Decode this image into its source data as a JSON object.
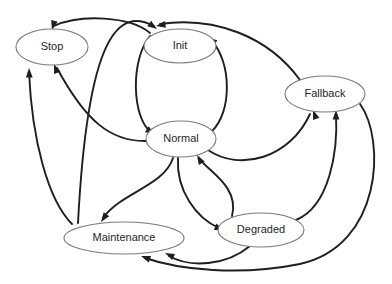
{
  "diagram": {
    "type": "state-transition-diagram",
    "title": "",
    "background_color": "#ffffff",
    "node_fill": "#ffffff",
    "node_stroke": "#7a7a7a",
    "edge_color": "#1f1f1f",
    "label_color": "#262626",
    "nodes": [
      {
        "id": "stop",
        "label": "Stop",
        "cx": 52,
        "cy": 47,
        "rx": 36,
        "ry": 18
      },
      {
        "id": "init",
        "label": "Init",
        "cx": 180,
        "cy": 46,
        "rx": 36,
        "ry": 17
      },
      {
        "id": "fallback",
        "label": "Fallback",
        "cx": 325,
        "cy": 94,
        "rx": 40,
        "ry": 18
      },
      {
        "id": "normal",
        "label": "Normal",
        "cx": 181,
        "cy": 139,
        "rx": 35,
        "ry": 18
      },
      {
        "id": "maintenance",
        "label": "Maintenance",
        "cx": 124,
        "cy": 238,
        "rx": 60,
        "ry": 16
      },
      {
        "id": "degraded",
        "label": "Degraded",
        "cx": 261,
        "cy": 230,
        "rx": 43,
        "ry": 17
      }
    ],
    "edges": [
      {
        "from": "init",
        "to": "stop",
        "path": "M 150 33 C 130 16 80 14 54 26",
        "arrow_at": [
          52,
          30
        ],
        "arrow_angle": 105
      },
      {
        "from": "init",
        "to": "normal",
        "path": "M 150 36 C 130 60 132 118 151 132",
        "arrow_at": [
          155,
          134
        ],
        "arrow_angle": 30
      },
      {
        "from": "normal",
        "to": "init",
        "path": "M 212 131 C 232 112 232 62 211 40",
        "arrow_at": [
          208,
          37
        ],
        "arrow_angle": 220
      },
      {
        "from": "normal",
        "to": "stop",
        "path": "M 147 141 C 110 142 85 120 57 68",
        "arrow_at": [
          54,
          64
        ],
        "arrow_angle": 250
      },
      {
        "from": "normal",
        "to": "fallback",
        "path": "M 208 150 C 240 172 290 158 310 114",
        "arrow_at": [
          313,
          110
        ],
        "arrow_angle": 250
      },
      {
        "from": "normal",
        "to": "degraded",
        "path": "M 178 158 C 176 190 196 218 219 228",
        "arrow_at": [
          224,
          230
        ],
        "arrow_angle": 20
      },
      {
        "from": "normal",
        "to": "maintenance",
        "path": "M 173 158 C 164 186 122 192 103 218",
        "arrow_at": [
          101,
          222
        ],
        "arrow_angle": 125
      },
      {
        "from": "maintenance",
        "to": "stop",
        "path": "M 72 224 C 48 200 32 140 29 72",
        "arrow_at": [
          29,
          68
        ],
        "arrow_angle": 268
      },
      {
        "from": "maintenance",
        "to": "init",
        "path": "M 78 223 C 88 30 120 8 154 26",
        "arrow_at": [
          157,
          29
        ],
        "arrow_angle": 35
      },
      {
        "from": "degraded",
        "to": "fallback",
        "path": "M 296 220 C 330 206 338 150 336 114",
        "arrow_at": [
          336,
          110
        ],
        "arrow_angle": 270
      },
      {
        "from": "degraded",
        "to": "maintenance",
        "path": "M 250 246 C 226 266 190 268 169 256",
        "arrow_at": [
          165,
          253
        ],
        "arrow_angle": 205
      },
      {
        "from": "fallback",
        "to": "init",
        "path": "M 300 80 C 268 36 214 16 160 24",
        "arrow_at": [
          156,
          26
        ],
        "arrow_angle": 170
      },
      {
        "from": "fallback",
        "to": "maintenance",
        "path": "M 360 104 C 386 140 382 246 300 264 C 240 276 180 270 145 258",
        "arrow_at": [
          141,
          256
        ],
        "arrow_angle": 200
      },
      {
        "from": "degraded",
        "to": "normal",
        "path": "M 232 216 C 240 186 206 170 199 158",
        "arrow_at": [
          197,
          155
        ],
        "arrow_angle": 240
      }
    ]
  }
}
